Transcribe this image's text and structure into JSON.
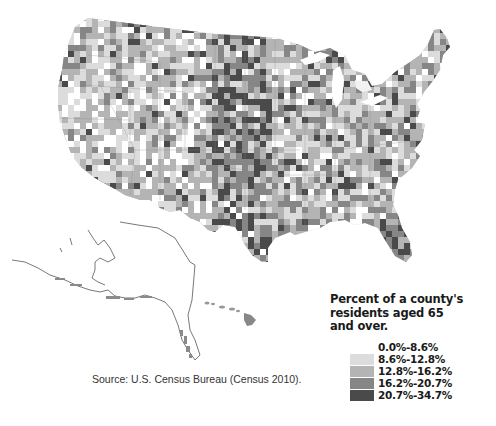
{
  "map": {
    "title": "Percent of a county's residents aged 65 and over.",
    "regions_shown": [
      "Contiguous United States",
      "Alaska",
      "Hawaii"
    ],
    "color_scheme": "grayscale choropleth",
    "colors": {
      "background": "#ffffff",
      "outline": "#555555"
    }
  },
  "legend": {
    "title": "Percent of a county's\nresidents aged 65\nand over.",
    "items": [
      {
        "label": "0.0%-8.6%",
        "color": "#ffffff"
      },
      {
        "label": "8.6%-12.8%",
        "color": "#dcdcdc"
      },
      {
        "label": "12.8%-16.2%",
        "color": "#b4b4b4"
      },
      {
        "label": "16.2%-20.7%",
        "color": "#868686"
      },
      {
        "label": "20.7%-34.7%",
        "color": "#4a4a4a"
      }
    ]
  },
  "source": {
    "text": "Source:  U.S. Census Bureau (Census 2010)."
  }
}
